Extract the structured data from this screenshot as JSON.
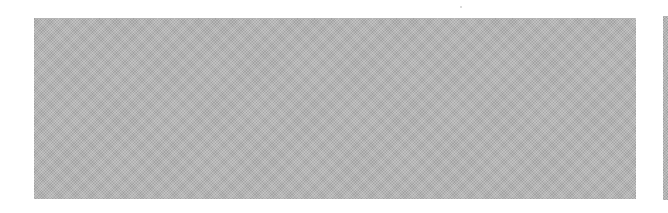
{
  "page": {
    "blocks": [
      {
        "name": "main-halftone-block",
        "color": "#b4b4b4"
      },
      {
        "name": "side-halftone-block",
        "color": "#b4b4b4"
      }
    ]
  }
}
